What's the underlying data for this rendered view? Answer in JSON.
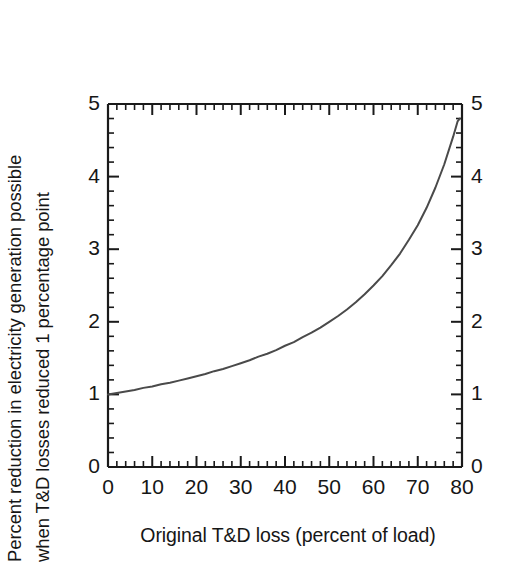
{
  "chart_data": {
    "type": "line",
    "title": "",
    "xlabel": "Original T&D loss (percent of load)",
    "ylabel_line1": "Percent reduction in electricity generation possible",
    "ylabel_line2": "when T&D losses reduced 1 percentage point",
    "xlim": [
      0,
      80
    ],
    "ylim": [
      0,
      5
    ],
    "xticks": [
      0,
      10,
      20,
      30,
      40,
      50,
      60,
      70,
      80
    ],
    "xtick_labels": [
      "0",
      "10",
      "20",
      "30",
      "40",
      "50",
      "60",
      "70",
      "80"
    ],
    "xminor_step": 2,
    "yticks": [
      0,
      1,
      2,
      3,
      4,
      5
    ],
    "ytick_labels": [
      "0",
      "1",
      "2",
      "3",
      "4",
      "5"
    ],
    "yticks_right_labels": [
      "0",
      "1",
      "2",
      "3",
      "4",
      "5"
    ],
    "yminor_step": 0.2,
    "grid": false,
    "legend": "none",
    "tick_direction": "in",
    "mirrored_axes": true,
    "line_color": "#4a4a4a",
    "line_width": 2.0,
    "axis_color": "#1a1a1a",
    "background": "#ffffff",
    "x": [
      0,
      2,
      4,
      6,
      8,
      10,
      12,
      14,
      16,
      18,
      20,
      22,
      24,
      26,
      28,
      30,
      32,
      34,
      36,
      38,
      40,
      42,
      44,
      46,
      48,
      50,
      52,
      54,
      56,
      58,
      60,
      62,
      64,
      66,
      68,
      70,
      72,
      74,
      76,
      78,
      79,
      79.5
    ],
    "y": [
      1.0,
      1.02,
      1.04,
      1.06,
      1.09,
      1.11,
      1.14,
      1.16,
      1.19,
      1.22,
      1.25,
      1.28,
      1.32,
      1.35,
      1.39,
      1.43,
      1.47,
      1.52,
      1.56,
      1.61,
      1.67,
      1.72,
      1.79,
      1.85,
      1.92,
      2.0,
      2.08,
      2.17,
      2.27,
      2.38,
      2.5,
      2.63,
      2.78,
      2.94,
      3.13,
      3.33,
      3.57,
      3.85,
      4.17,
      4.55,
      4.76,
      4.8
    ],
    "series": [
      {
        "name": "Percent reduction",
        "formula": "y = 100 / (100 - x)",
        "points": [
          {
            "x": 0,
            "y": 1.0
          },
          {
            "x": 10,
            "y": 1.11
          },
          {
            "x": 20,
            "y": 1.25
          },
          {
            "x": 30,
            "y": 1.43
          },
          {
            "x": 40,
            "y": 1.67
          },
          {
            "x": 50,
            "y": 2.0
          },
          {
            "x": 60,
            "y": 2.5
          },
          {
            "x": 70,
            "y": 3.33
          },
          {
            "x": 75,
            "y": 4.0
          },
          {
            "x": 78,
            "y": 4.55
          },
          {
            "x": 79.5,
            "y": 4.8
          }
        ]
      }
    ],
    "annotations": []
  }
}
